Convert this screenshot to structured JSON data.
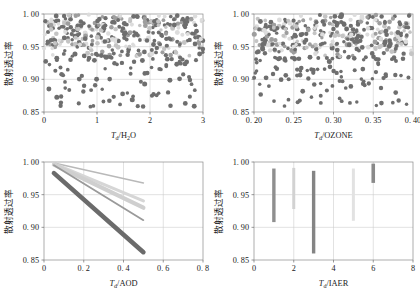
{
  "figure": {
    "panels": [
      {
        "id": "panel-h2o",
        "position": "top-left",
        "chart_data": {
          "type": "scatter",
          "title": "",
          "xlabel": "T_d/H2O",
          "xlabel_main": "T",
          "xlabel_sub": "d",
          "xlabel_rest": "/H",
          "xlabel_rest_sub": "2",
          "xlabel_tail": "O",
          "ylabel": "散射透过率",
          "xlim": [
            0,
            3
          ],
          "ylim": [
            0.85,
            1.0
          ],
          "xticks": [
            "0",
            "1",
            "2",
            "3"
          ],
          "xtick_values": [
            0,
            1,
            2,
            3
          ],
          "yticks": [
            "0. 85",
            "0. 90",
            "0. 95",
            "1. 00"
          ],
          "ytick_values": [
            0.85,
            0.9,
            0.95,
            1.0
          ],
          "grid": true,
          "legend": "none",
          "marker": "filled-circle",
          "marker_size": 2.0,
          "point_count": 430,
          "density_note": "dense band above 0.95, sparse scatter below 0.90",
          "colors": [
            "#6e6e6e",
            "#9e9e9e",
            "#c4c4c4",
            "#dcdcdc"
          ]
        }
      },
      {
        "id": "panel-ozone",
        "position": "top-right",
        "chart_data": {
          "type": "scatter",
          "title": "",
          "xlabel": "T_d/OZONE",
          "xlabel_main": "T",
          "xlabel_sub": "d",
          "xlabel_rest": "/OZONE",
          "ylabel": "散射透过率",
          "xlim": [
            0.2,
            0.4
          ],
          "ylim": [
            0.85,
            1.0
          ],
          "xticks": [
            "0. 20",
            "0. 25",
            "0. 30",
            "0. 35",
            "0. 40"
          ],
          "xtick_values": [
            0.2,
            0.25,
            0.3,
            0.35,
            0.4
          ],
          "yticks": [
            "0. 85",
            "0. 90",
            "0. 95",
            "1. 00"
          ],
          "ytick_values": [
            0.85,
            0.9,
            0.95,
            1.0
          ],
          "grid": true,
          "legend": "none",
          "marker": "filled-circle",
          "marker_size": 2.0,
          "point_count": 430,
          "density_note": "dense band above 0.95, sparse scatter below 0.90",
          "colors": [
            "#6e6e6e",
            "#9e9e9e",
            "#c4c4c4",
            "#dcdcdc"
          ]
        }
      },
      {
        "id": "panel-aod",
        "position": "bottom-left",
        "chart_data": {
          "type": "line",
          "title": "",
          "xlabel": "T_d/AOD",
          "xlabel_main": "T",
          "xlabel_sub": "d",
          "xlabel_rest": "/AOD",
          "ylabel": "散射透过率",
          "xlim": [
            0,
            0.8
          ],
          "ylim": [
            0.85,
            1.0
          ],
          "xticks": [
            "0",
            "0. 2",
            "0. 4",
            "0. 6",
            "0. 8"
          ],
          "xtick_values": [
            0,
            0.2,
            0.4,
            0.6,
            0.8
          ],
          "yticks": [
            "0. 85",
            "0. 90",
            "0. 95",
            "1. 00"
          ],
          "ytick_values": [
            0.85,
            0.9,
            0.95,
            1.0
          ],
          "grid": true,
          "legend": "none",
          "x": [
            0.05,
            0.5
          ],
          "series": [
            {
              "name": "band-1",
              "values": [
                0.9985,
                0.968
              ],
              "color": "#b9b9b9",
              "width": 1.6
            },
            {
              "name": "band-2",
              "values": [
                0.9975,
                0.9405
              ],
              "color": "#d6d6d6",
              "width": 3.2
            },
            {
              "name": "band-3",
              "values": [
                0.996,
                0.93
              ],
              "color": "#cfcfcf",
              "width": 4.2
            },
            {
              "name": "band-4",
              "values": [
                0.995,
                0.911
              ],
              "color": "#9a9a9a",
              "width": 1.8
            },
            {
              "name": "band-5",
              "values": [
                0.983,
                0.862
              ],
              "color": "#6b6b6b",
              "width": 4.6
            }
          ]
        }
      },
      {
        "id": "panel-iaer",
        "position": "bottom-right",
        "chart_data": {
          "type": "bar",
          "orientation": "vertical-range",
          "title": "",
          "xlabel": "T_d/IAER",
          "xlabel_main": "T",
          "xlabel_sub": "d",
          "xlabel_rest": "/IAER",
          "ylabel": "散射透过率",
          "xlim": [
            0,
            8
          ],
          "ylim": [
            0.85,
            1.0
          ],
          "xticks": [
            "0",
            "2",
            "4",
            "6",
            "8"
          ],
          "xtick_values": [
            0,
            2,
            4,
            6,
            8
          ],
          "yticks": [
            "0. 85",
            "0. 90",
            "0. 95",
            "1. 00"
          ],
          "ytick_values": [
            0.85,
            0.9,
            0.95,
            1.0
          ],
          "grid": true,
          "legend": "none",
          "categories": [
            1,
            2,
            3,
            5,
            6
          ],
          "bars": [
            {
              "x": 1,
              "low": 0.908,
              "high": 0.99,
              "color": "#8f8f8f",
              "width": 3.4
            },
            {
              "x": 2,
              "low": 0.928,
              "high": 0.991,
              "color": "#d2d2d2",
              "width": 3.0
            },
            {
              "x": 3,
              "low": 0.86,
              "high": 0.9865,
              "color": "#848484",
              "width": 3.4
            },
            {
              "x": 5,
              "low": 0.91,
              "high": 0.99,
              "color": "#e2e2e2",
              "width": 3.0
            },
            {
              "x": 6,
              "low": 0.968,
              "high": 0.9975,
              "color": "#8a8a8a",
              "width": 3.6
            }
          ]
        }
      }
    ]
  }
}
